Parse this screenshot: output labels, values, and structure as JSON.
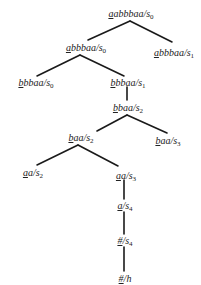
{
  "diagram": {
    "type": "tree",
    "nodes": [
      {
        "id": "n0",
        "first": "a",
        "rest": "abbbaa",
        "state": "s",
        "sub": "0",
        "x": 131,
        "y": 8
      },
      {
        "id": "n1",
        "first": "a",
        "rest": "bbbaa",
        "state": "s",
        "sub": "0",
        "x": 86,
        "y": 42
      },
      {
        "id": "n2",
        "first": "a",
        "rest": "bbbaa",
        "state": "s",
        "sub": "1",
        "x": 174,
        "y": 47
      },
      {
        "id": "n3",
        "first": "b",
        "rest": "bbaa",
        "state": "s",
        "sub": "0",
        "x": 36,
        "y": 77
      },
      {
        "id": "n4",
        "first": "b",
        "rest": "bbaa",
        "state": "s",
        "sub": "1",
        "x": 128,
        "y": 77
      },
      {
        "id": "n5",
        "first": "b",
        "rest": "baa",
        "state": "s",
        "sub": "2",
        "x": 128,
        "y": 102
      },
      {
        "id": "n6",
        "first": "b",
        "rest": "aa",
        "state": "s",
        "sub": "2",
        "x": 81,
        "y": 132
      },
      {
        "id": "n7",
        "first": "b",
        "rest": "aa",
        "state": "s",
        "sub": "3",
        "x": 168,
        "y": 135
      },
      {
        "id": "n8",
        "first": "a",
        "rest": "a",
        "state": "s",
        "sub": "2",
        "x": 33,
        "y": 167
      },
      {
        "id": "n9",
        "first": "a",
        "rest": "a",
        "state": "s",
        "sub": "3",
        "x": 126,
        "y": 170
      },
      {
        "id": "n10",
        "first": "a",
        "rest": "",
        "state": "s",
        "sub": "4",
        "x": 125,
        "y": 200
      },
      {
        "id": "n11",
        "first": "#",
        "rest": "",
        "state": "s",
        "sub": "4",
        "x": 125,
        "y": 235
      },
      {
        "id": "n12",
        "first": "#",
        "rest": "",
        "state": "h",
        "sub": "",
        "x": 125,
        "y": 273
      }
    ],
    "edges": [
      {
        "from": "n0",
        "to": "n1",
        "x1": 130,
        "y1": 21,
        "x2": 88,
        "y2": 40
      },
      {
        "from": "n0",
        "to": "n2",
        "x1": 130,
        "y1": 21,
        "x2": 172,
        "y2": 42
      },
      {
        "from": "n1",
        "to": "n3",
        "x1": 80,
        "y1": 55,
        "x2": 37,
        "y2": 76
      },
      {
        "from": "n1",
        "to": "n4",
        "x1": 80,
        "y1": 55,
        "x2": 124,
        "y2": 76
      },
      {
        "from": "n4",
        "to": "n5",
        "x1": 127,
        "y1": 87,
        "x2": 127,
        "y2": 100
      },
      {
        "from": "n5",
        "to": "n6",
        "x1": 127,
        "y1": 115,
        "x2": 97,
        "y2": 131
      },
      {
        "from": "n5",
        "to": "n7",
        "x1": 127,
        "y1": 115,
        "x2": 167,
        "y2": 133
      },
      {
        "from": "n6",
        "to": "n8",
        "x1": 78,
        "y1": 145,
        "x2": 37,
        "y2": 165
      },
      {
        "from": "n6",
        "to": "n9",
        "x1": 78,
        "y1": 145,
        "x2": 118,
        "y2": 166
      },
      {
        "from": "n9",
        "to": "n10",
        "x1": 124,
        "y1": 180,
        "x2": 124,
        "y2": 199
      },
      {
        "from": "n10",
        "to": "n11",
        "x1": 124,
        "y1": 212,
        "x2": 124,
        "y2": 234
      },
      {
        "from": "n11",
        "to": "n12",
        "x1": 124,
        "y1": 247,
        "x2": 124,
        "y2": 271
      }
    ]
  },
  "labels": {
    "n0": {
      "first": "a",
      "rest": "abbbaa",
      "slash": "/",
      "state": "s",
      "sub": "0"
    },
    "n1": {
      "first": "a",
      "rest": "bbbaa",
      "slash": "/",
      "state": "s",
      "sub": "0"
    },
    "n2": {
      "first": "a",
      "rest": "bbbaa",
      "slash": "/",
      "state": "s",
      "sub": "1"
    },
    "n3": {
      "first": "b",
      "rest": "bbaa",
      "slash": "/",
      "state": "s",
      "sub": "0"
    },
    "n4": {
      "first": "b",
      "rest": "bbaa",
      "slash": "/",
      "state": "s",
      "sub": "1"
    },
    "n5": {
      "first": "b",
      "rest": "baa",
      "slash": "/",
      "state": "s",
      "sub": "2"
    },
    "n6": {
      "first": "b",
      "rest": "aa",
      "slash": "/",
      "state": "s",
      "sub": "2"
    },
    "n7": {
      "first": "b",
      "rest": "aa",
      "slash": "/",
      "state": "s",
      "sub": "3"
    },
    "n8": {
      "first": "a",
      "rest": "a",
      "slash": "/",
      "state": "s",
      "sub": "2"
    },
    "n9": {
      "first": "a",
      "rest": "a",
      "slash": "/",
      "state": "s",
      "sub": "3"
    },
    "n10": {
      "first": "a",
      "rest": "",
      "slash": "/",
      "state": "s",
      "sub": "4"
    },
    "n11": {
      "first": "#",
      "rest": "",
      "slash": "/",
      "state": "s",
      "sub": "4"
    },
    "n12": {
      "first": "#",
      "rest": "",
      "slash": "/",
      "state": "h",
      "sub": ""
    }
  },
  "colors": {
    "ink": "#1a1a1a",
    "background": "#ffffff"
  }
}
